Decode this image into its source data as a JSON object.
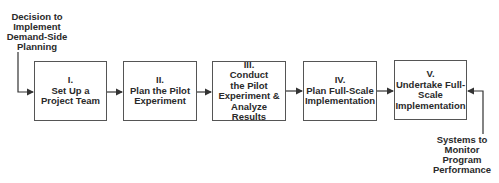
{
  "diagram": {
    "type": "flowchart",
    "input_label": [
      "Decision to",
      "Implement",
      "Demand-Side",
      "Planning"
    ],
    "feedback_label": [
      "Systems to",
      "Monitor",
      "Program",
      "Performance"
    ],
    "steps": [
      {
        "numeral": "I.",
        "lines": [
          "Set Up a",
          "Project Team"
        ]
      },
      {
        "numeral": "II.",
        "lines": [
          "Plan the Pilot",
          "Experiment"
        ]
      },
      {
        "numeral": "III.",
        "lines": [
          "Conduct",
          "the Pilot",
          "Experiment &",
          "Analyze",
          "Results"
        ]
      },
      {
        "numeral": "IV.",
        "lines": [
          "Plan Full-Scale",
          "Implementation"
        ]
      },
      {
        "numeral": "V.",
        "lines": [
          "Undertake Full-",
          "Scale",
          "Implementation"
        ]
      }
    ]
  }
}
